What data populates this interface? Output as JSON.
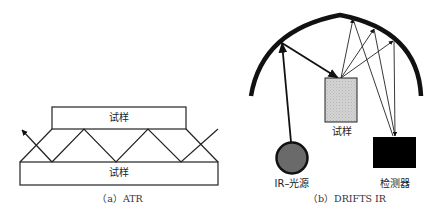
{
  "figure": {
    "panel_a": {
      "caption": "（a）ATR",
      "top_box_label": "试样",
      "bottom_box_label": "试样"
    },
    "panel_b": {
      "caption": "（b）DRIFTS IR",
      "sample_label": "试样",
      "source_label": "IR–光源",
      "detector_label": "检测器"
    }
  },
  "colors": {
    "line": "#1a1a1a",
    "source_fill": "#666666",
    "sample_fill": "#cfcfcf",
    "detector_fill": "#000000"
  }
}
